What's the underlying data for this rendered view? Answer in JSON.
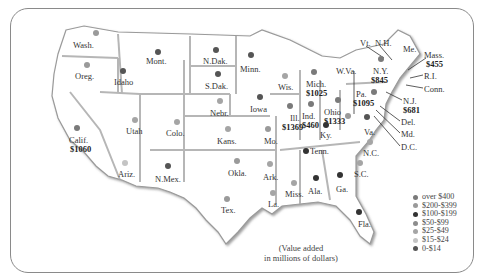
{
  "legend": {
    "items": [
      {
        "label": "over $400",
        "color": "#7a7a7a"
      },
      {
        "label": "$200-$399",
        "color": "#9a9a9a"
      },
      {
        "label": "$100-$199",
        "color": "#333333"
      },
      {
        "label": "$50-$99",
        "color": "#8d8d8d"
      },
      {
        "label": "$25-$49",
        "color": "#a5a5a5"
      },
      {
        "label": "$15-$24",
        "color": "#c4c4c4"
      },
      {
        "label": "0-$14",
        "color": "#555555"
      }
    ]
  },
  "note": {
    "line1": "(Value added",
    "line2": "in millions of dollars)"
  },
  "states": [
    {
      "id": "wash",
      "label": "Wash.",
      "x": 73,
      "y": 41,
      "dot": {
        "x": 96,
        "y": 33,
        "c": "#9a9a9a"
      }
    },
    {
      "id": "oreg",
      "label": "Oreg.",
      "x": 75,
      "y": 72,
      "dot": {
        "x": 87,
        "y": 65,
        "c": "#9a9a9a"
      }
    },
    {
      "id": "idaho",
      "label": "Idaho",
      "x": 114,
      "y": 78,
      "dot": {
        "x": 123,
        "y": 71,
        "c": "#555555"
      }
    },
    {
      "id": "mont",
      "label": "Mont.",
      "x": 146,
      "y": 57,
      "dot": {
        "x": 158,
        "y": 52,
        "c": "#555555"
      }
    },
    {
      "id": "ndak",
      "label": "N.Dak.",
      "x": 203,
      "y": 57,
      "dot": {
        "x": 216,
        "y": 50,
        "c": "#555555"
      }
    },
    {
      "id": "sdak",
      "label": "S.Dak.",
      "x": 205,
      "y": 82,
      "dot": {
        "x": 218,
        "y": 74,
        "c": "#555555"
      }
    },
    {
      "id": "minn",
      "label": "Minn.",
      "x": 240,
      "y": 65,
      "dot": {
        "x": 251,
        "y": 55,
        "c": "#555555"
      }
    },
    {
      "id": "wis",
      "label": "Wis.",
      "x": 278,
      "y": 83,
      "dot": {
        "x": 285,
        "y": 76,
        "c": "#a5a5a5"
      }
    },
    {
      "id": "mich",
      "label": "Mich.",
      "x": 306,
      "y": 80,
      "value": "$1025",
      "vx": 306,
      "vy": 89,
      "dot": {
        "x": 314,
        "y": 72,
        "c": "#7a7a7a"
      }
    },
    {
      "id": "nebr",
      "label": "Nebr.",
      "x": 210,
      "y": 109,
      "dot": {
        "x": 220,
        "y": 101,
        "c": "#a5a5a5"
      }
    },
    {
      "id": "iowa",
      "label": "Iowa",
      "x": 250,
      "y": 105,
      "dot": {
        "x": 260,
        "y": 97,
        "c": "#555555"
      }
    },
    {
      "id": "ill",
      "label": "Ill.",
      "x": 290,
      "y": 114,
      "value": "$1369",
      "vx": 282,
      "vy": 123,
      "dot": {
        "x": 290,
        "y": 106,
        "c": "#7a7a7a"
      }
    },
    {
      "id": "ind",
      "label": "Ind.",
      "x": 302,
      "y": 112,
      "value": "$460",
      "vx": 302,
      "vy": 121,
      "dot": {
        "x": 311,
        "y": 104,
        "c": "#7a7a7a"
      }
    },
    {
      "id": "ohio",
      "label": "Ohio",
      "x": 324,
      "y": 108,
      "value": "$1333",
      "vx": 324,
      "vy": 117,
      "dot": {
        "x": 338,
        "y": 100,
        "c": "#7a7a7a"
      }
    },
    {
      "id": "wva",
      "label": "W.Va.",
      "x": 336,
      "y": 67,
      "dot": {
        "x": 348,
        "y": 116,
        "c": "#9a9a9a"
      }
    },
    {
      "id": "ky",
      "label": "Ky.",
      "x": 320,
      "y": 131,
      "dot": {
        "x": 326,
        "y": 125,
        "c": "#333333"
      }
    },
    {
      "id": "utah",
      "label": "Utah",
      "x": 126,
      "y": 127,
      "dot": {
        "x": 135,
        "y": 120,
        "c": "#a5a5a5"
      }
    },
    {
      "id": "colo",
      "label": "Colo.",
      "x": 166,
      "y": 129,
      "dot": {
        "x": 177,
        "y": 122,
        "c": "#a5a5a5"
      }
    },
    {
      "id": "kans",
      "label": "Kans.",
      "x": 217,
      "y": 137,
      "dot": {
        "x": 228,
        "y": 129,
        "c": "#a5a5a5"
      }
    },
    {
      "id": "mo",
      "label": "Mo.",
      "x": 264,
      "y": 137,
      "dot": {
        "x": 268,
        "y": 129,
        "c": "#9a9a9a"
      }
    },
    {
      "id": "calif",
      "label": "Calif.",
      "x": 69,
      "y": 136,
      "value": "$1060",
      "vx": 70,
      "vy": 145,
      "dot": {
        "x": 77,
        "y": 128,
        "c": "#7a7a7a"
      }
    },
    {
      "id": "ariz",
      "label": "Ariz.",
      "x": 118,
      "y": 170,
      "dot": {
        "x": 125,
        "y": 163,
        "c": "#c4c4c4"
      }
    },
    {
      "id": "nmex",
      "label": "N.Mex.",
      "x": 155,
      "y": 175,
      "dot": {
        "x": 168,
        "y": 166,
        "c": "#555555"
      }
    },
    {
      "id": "okla",
      "label": "Okla.",
      "x": 228,
      "y": 169,
      "dot": {
        "x": 237,
        "y": 161,
        "c": "#9a9a9a"
      }
    },
    {
      "id": "ark",
      "label": "Ark.",
      "x": 263,
      "y": 173,
      "dot": {
        "x": 270,
        "y": 164,
        "c": "#a5a5a5"
      }
    },
    {
      "id": "tenn",
      "label": "Tenn.",
      "x": 310,
      "y": 147,
      "dot": {
        "x": 306,
        "y": 151,
        "c": "#333333"
      }
    },
    {
      "id": "tex",
      "label": "Tex.",
      "x": 221,
      "y": 206,
      "dot": {
        "x": 227,
        "y": 199,
        "c": "#9a9a9a"
      }
    },
    {
      "id": "miss",
      "label": "Miss.",
      "x": 285,
      "y": 190,
      "dot": {
        "x": 294,
        "y": 183,
        "c": "#a5a5a5"
      }
    },
    {
      "id": "la",
      "label": "La.",
      "x": 268,
      "y": 200,
      "dot": {
        "x": 273,
        "y": 193,
        "c": "#a5a5a5"
      }
    },
    {
      "id": "ala",
      "label": "Ala.",
      "x": 308,
      "y": 187,
      "dot": {
        "x": 316,
        "y": 178,
        "c": "#333333"
      }
    },
    {
      "id": "ga",
      "label": "Ga.",
      "x": 336,
      "y": 185,
      "dot": {
        "x": 340,
        "y": 175,
        "c": "#333333"
      }
    },
    {
      "id": "sc",
      "label": "S.C.",
      "x": 354,
      "y": 170,
      "dot": {
        "x": 360,
        "y": 163,
        "c": "#a5a5a5"
      }
    },
    {
      "id": "nc",
      "label": "N.C.",
      "x": 363,
      "y": 149,
      "dot": {
        "x": 370,
        "y": 142,
        "c": "#a5a5a5"
      }
    },
    {
      "id": "fla",
      "label": "Fla.",
      "x": 358,
      "y": 220,
      "dot": {
        "x": 359,
        "y": 212,
        "c": "#333333"
      }
    },
    {
      "id": "va",
      "label": "Va.",
      "x": 364,
      "y": 128,
      "dot": {
        "x": 367,
        "y": 117,
        "c": "#555555"
      }
    },
    {
      "id": "pa",
      "label": "Pa.",
      "x": 356,
      "y": 90,
      "value": "$1095",
      "vx": 353,
      "vy": 99,
      "dot": {
        "x": 374,
        "y": 92,
        "c": "#7a7a7a"
      }
    },
    {
      "id": "ny",
      "label": "N.Y.",
      "x": 373,
      "y": 67,
      "value": "$845",
      "vx": 371,
      "vy": 76,
      "dot": {
        "x": 381,
        "y": 59,
        "c": "#7a7a7a"
      }
    }
  ],
  "northeast": [
    {
      "id": "vt",
      "label": "Vt.",
      "x": 360,
      "y": 39
    },
    {
      "id": "nh",
      "label": "N.H.",
      "x": 375,
      "y": 39
    },
    {
      "id": "me",
      "label": "Me.",
      "x": 403,
      "y": 45
    },
    {
      "id": "mass",
      "label": "Mass.",
      "x": 424,
      "y": 51,
      "value": "$455",
      "vx": 426,
      "vy": 60
    },
    {
      "id": "ri",
      "label": "R.I.",
      "x": 424,
      "y": 72
    },
    {
      "id": "conn",
      "label": "Conn.",
      "x": 424,
      "y": 85
    },
    {
      "id": "nj",
      "label": "N.J.",
      "x": 403,
      "y": 97,
      "value": "$681",
      "vx": 403,
      "vy": 106
    },
    {
      "id": "del",
      "label": "Del.",
      "x": 401,
      "y": 118
    },
    {
      "id": "md",
      "label": "Md.",
      "x": 401,
      "y": 130
    },
    {
      "id": "dc",
      "label": "D.C.",
      "x": 401,
      "y": 143
    }
  ]
}
